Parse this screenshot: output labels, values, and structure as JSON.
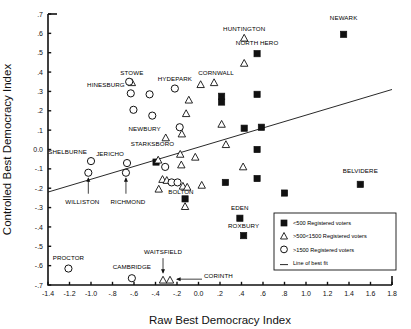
{
  "chart_data": {
    "type": "scatter",
    "title": "",
    "xlabel": "Raw Best Democracy Index",
    "ylabel": "Controlled Best Democracy Index",
    "xlim": [
      -1.4,
      1.8
    ],
    "ylim": [
      -0.7,
      0.7
    ],
    "xticks": [
      "-1.4",
      "-1.2",
      "-1.0",
      "-.8",
      "-.6",
      "-.4",
      "-.2",
      "0.0",
      ".2",
      ".4",
      ".6",
      ".8",
      "1.0",
      "1.2",
      "1.4",
      "1.6",
      "1.8"
    ],
    "xtick_values": [
      -1.4,
      -1.2,
      -1.0,
      -0.8,
      -0.6,
      -0.4,
      -0.2,
      0.0,
      0.2,
      0.4,
      0.6,
      0.8,
      1.0,
      1.2,
      1.4,
      1.6,
      1.8
    ],
    "yticks": [
      ".7",
      ".6",
      ".5",
      ".4",
      ".3",
      ".2",
      ".1",
      "0.0",
      "-.1",
      "-.2",
      "-.3",
      "-.4",
      "-.5",
      "-.6",
      "-.7"
    ],
    "ytick_values": [
      0.7,
      0.6,
      0.5,
      0.4,
      0.3,
      0.2,
      0.1,
      0.0,
      -0.1,
      -0.2,
      -0.3,
      -0.4,
      -0.5,
      -0.6,
      -0.7
    ],
    "grid": false,
    "legend_position": "bottom-right",
    "line_of_best_fit": {
      "x": [
        -1.4,
        1.8
      ],
      "y": [
        -0.22,
        0.31
      ]
    },
    "series": [
      {
        "name": "<500 Registered voters",
        "marker": "square",
        "points": [
          {
            "x": 1.35,
            "y": 0.595,
            "label": "NEWARK",
            "label_dx": 0,
            "label_dy": -14,
            "label_anchor": "middle"
          },
          {
            "x": 0.545,
            "y": 0.495,
            "label": "NORTH HERO",
            "label_dx": 0,
            "label_dy": -9,
            "label_anchor": "middle"
          },
          {
            "x": 0.215,
            "y": 0.275,
            "label": "",
            "label_dx": 0,
            "label_dy": 0,
            "label_anchor": "middle"
          },
          {
            "x": 0.545,
            "y": 0.285,
            "label": "",
            "label_dx": 0,
            "label_dy": 0,
            "label_anchor": "middle"
          },
          {
            "x": 0.425,
            "y": 0.11,
            "label": "",
            "label_dx": 0,
            "label_dy": 0,
            "label_anchor": "middle"
          },
          {
            "x": 0.585,
            "y": 0.115,
            "label": "",
            "label_dx": 0,
            "label_dy": 0,
            "label_anchor": "middle"
          },
          {
            "x": 0.545,
            "y": 0.0,
            "label": "",
            "label_dx": 0,
            "label_dy": 0,
            "label_anchor": "middle"
          },
          {
            "x": -0.395,
            "y": -0.065,
            "label": "",
            "label_dx": 0,
            "label_dy": 0,
            "label_anchor": "middle"
          },
          {
            "x": 0.25,
            "y": -0.17,
            "label": "",
            "label_dx": 0,
            "label_dy": 0,
            "label_anchor": "middle"
          },
          {
            "x": 0.545,
            "y": -0.15,
            "label": "",
            "label_dx": 0,
            "label_dy": 0,
            "label_anchor": "middle"
          },
          {
            "x": 1.505,
            "y": -0.18,
            "label": "BELVIDERE",
            "label_dx": 0,
            "label_dy": -11,
            "label_anchor": "middle"
          },
          {
            "x": 0.8,
            "y": -0.225,
            "label": "",
            "label_dx": 0,
            "label_dy": 0,
            "label_anchor": "middle"
          },
          {
            "x": -0.125,
            "y": -0.255,
            "label": "",
            "label_dx": 0,
            "label_dy": 0,
            "label_anchor": "middle"
          },
          {
            "x": 0.385,
            "y": -0.355,
            "label": "EDEN",
            "label_dx": 0,
            "label_dy": -8,
            "label_anchor": "middle"
          },
          {
            "x": 0.42,
            "y": -0.445,
            "label": "ROXBURY",
            "label_dx": 0,
            "label_dy": -8,
            "label_anchor": "middle"
          },
          {
            "x": 0.215,
            "y": 0.245,
            "label": "",
            "label_dx": 0,
            "label_dy": 0,
            "label_anchor": "middle"
          }
        ]
      },
      {
        "name": ">500<1500 Registered voters",
        "marker": "triangle",
        "points": [
          {
            "x": 0.425,
            "y": 0.575,
            "label": "HUNTINGTON",
            "label_dx": 0,
            "label_dy": -7,
            "label_anchor": "middle"
          },
          {
            "x": 0.425,
            "y": 0.445,
            "label": "",
            "label_dx": 0,
            "label_dy": 0,
            "label_anchor": "middle"
          },
          {
            "x": -0.62,
            "y": 0.345,
            "label": "STOWE",
            "label_dx": 0,
            "label_dy": -8,
            "label_anchor": "middle"
          },
          {
            "x": 0.02,
            "y": 0.335,
            "label": "",
            "label_dx": 0,
            "label_dy": 0,
            "label_anchor": "middle"
          },
          {
            "x": 0.145,
            "y": 0.345,
            "label": "CORNWALL",
            "label_dx": 2,
            "label_dy": -8,
            "label_anchor": "middle"
          },
          {
            "x": -0.09,
            "y": 0.255,
            "label": "",
            "label_dx": 0,
            "label_dy": 0,
            "label_anchor": "middle"
          },
          {
            "x": -0.115,
            "y": 0.185,
            "label": "",
            "label_dx": 0,
            "label_dy": 0,
            "label_anchor": "middle"
          },
          {
            "x": 0.215,
            "y": 0.13,
            "label": "",
            "label_dx": 0,
            "label_dy": 0,
            "label_anchor": "middle"
          },
          {
            "x": -0.305,
            "y": 0.06,
            "label": "NEWBURY",
            "label_dx": -5,
            "label_dy": -7,
            "label_anchor": "end"
          },
          {
            "x": -0.155,
            "y": 0.08,
            "label": "",
            "label_dx": 0,
            "label_dy": 0,
            "label_anchor": "middle"
          },
          {
            "x": 0.255,
            "y": 0.025,
            "label": "",
            "label_dx": 0,
            "label_dy": 0,
            "label_anchor": "middle"
          },
          {
            "x": -0.17,
            "y": -0.025,
            "label": "STARKSBORO",
            "label_dx": -6,
            "label_dy": -8,
            "label_anchor": "end"
          },
          {
            "x": -0.03,
            "y": -0.04,
            "label": "",
            "label_dx": 0,
            "label_dy": 0,
            "label_anchor": "middle"
          },
          {
            "x": -0.375,
            "y": -0.055,
            "label": "",
            "label_dx": 0,
            "label_dy": 0,
            "label_anchor": "middle"
          },
          {
            "x": -0.16,
            "y": -0.08,
            "label": "",
            "label_dx": 0,
            "label_dy": 0,
            "label_anchor": "middle"
          },
          {
            "x": 0.415,
            "y": -0.09,
            "label": "",
            "label_dx": 0,
            "label_dy": 0,
            "label_anchor": "middle"
          },
          {
            "x": -0.335,
            "y": -0.155,
            "label": "",
            "label_dx": 0,
            "label_dy": 0,
            "label_anchor": "middle"
          },
          {
            "x": -0.295,
            "y": -0.16,
            "label": "",
            "label_dx": 0,
            "label_dy": 0,
            "label_anchor": "middle"
          },
          {
            "x": -0.145,
            "y": -0.19,
            "label": "BOLTON",
            "label_dx": -2,
            "label_dy": 8,
            "label_anchor": "middle"
          },
          {
            "x": -0.105,
            "y": -0.195,
            "label": "",
            "label_dx": 0,
            "label_dy": 0,
            "label_anchor": "middle"
          },
          {
            "x": 0.03,
            "y": -0.185,
            "label": "",
            "label_dx": 0,
            "label_dy": 0,
            "label_anchor": "middle"
          },
          {
            "x": -0.37,
            "y": -0.205,
            "label": "",
            "label_dx": 0,
            "label_dy": 0,
            "label_anchor": "middle"
          },
          {
            "x": -0.125,
            "y": -0.295,
            "label": "",
            "label_dx": 0,
            "label_dy": 0,
            "label_anchor": "middle"
          },
          {
            "x": -0.33,
            "y": -0.675,
            "label": "WAITSFIELD",
            "label_dx": 0,
            "label_dy": -26,
            "label_anchor": "middle"
          },
          {
            "x": -0.265,
            "y": -0.675,
            "label": "CORINTH",
            "label_dx": 34,
            "label_dy": -2,
            "label_anchor": "start"
          }
        ]
      },
      {
        "name": ">1500 Registered voters",
        "marker": "circle",
        "points": [
          {
            "x": -0.645,
            "y": 0.35,
            "label": "",
            "label_dx": 0,
            "label_dy": 0,
            "label_anchor": "middle"
          },
          {
            "x": -0.63,
            "y": 0.29,
            "label": "HINESBURG",
            "label_dx": -6,
            "label_dy": -6,
            "label_anchor": "end"
          },
          {
            "x": -0.455,
            "y": 0.285,
            "label": "",
            "label_dx": 0,
            "label_dy": 0,
            "label_anchor": "middle"
          },
          {
            "x": -0.605,
            "y": 0.205,
            "label": "",
            "label_dx": 0,
            "label_dy": 0,
            "label_anchor": "middle"
          },
          {
            "x": -0.22,
            "y": 0.315,
            "label": "HYDEPARK",
            "label_dx": 0,
            "label_dy": -8,
            "label_anchor": "middle"
          },
          {
            "x": -0.43,
            "y": 0.175,
            "label": "",
            "label_dx": 0,
            "label_dy": 0,
            "label_anchor": "middle"
          },
          {
            "x": -0.175,
            "y": 0.115,
            "label": "",
            "label_dx": 0,
            "label_dy": 0,
            "label_anchor": "middle"
          },
          {
            "x": -1.0,
            "y": -0.06,
            "label": "SHELBURNE",
            "label_dx": -4,
            "label_dy": -7,
            "label_anchor": "end"
          },
          {
            "x": -0.665,
            "y": -0.07,
            "label": "JERICHO",
            "label_dx": -3,
            "label_dy": -7,
            "label_anchor": "end"
          },
          {
            "x": -1.025,
            "y": -0.12,
            "label": "WILLISTON",
            "label_dx": -6,
            "label_dy": 31,
            "label_anchor": "middle"
          },
          {
            "x": -0.675,
            "y": -0.12,
            "label": "RICHMOND",
            "label_dx": 2,
            "label_dy": 31,
            "label_anchor": "middle"
          },
          {
            "x": -0.31,
            "y": -0.09,
            "label": "",
            "label_dx": 0,
            "label_dy": 0,
            "label_anchor": "middle"
          },
          {
            "x": -0.25,
            "y": -0.17,
            "label": "",
            "label_dx": 0,
            "label_dy": 0,
            "label_anchor": "middle"
          },
          {
            "x": -0.195,
            "y": -0.17,
            "label": "",
            "label_dx": 0,
            "label_dy": 0,
            "label_anchor": "middle"
          },
          {
            "x": -1.21,
            "y": -0.615,
            "label": "PROCTOR",
            "label_dx": 0,
            "label_dy": -9,
            "label_anchor": "middle"
          },
          {
            "x": -0.62,
            "y": -0.665,
            "label": "CAMBRIDGE",
            "label_dx": 0,
            "label_dy": -9,
            "label_anchor": "middle"
          }
        ]
      }
    ],
    "legend_entries": [
      {
        "marker": "square",
        "label": "<500  Registered voters"
      },
      {
        "marker": "triangle",
        "label": ">500<1500  Registered voters"
      },
      {
        "marker": "circle",
        "label": ">1500 Registered voters"
      },
      {
        "marker": "line",
        "label": "Line of best fit"
      }
    ],
    "colors": {
      "ink": "#111111",
      "marker_fill_filled": "#111111",
      "marker_fill_open": "#ffffff",
      "background": "#ffffff"
    }
  }
}
